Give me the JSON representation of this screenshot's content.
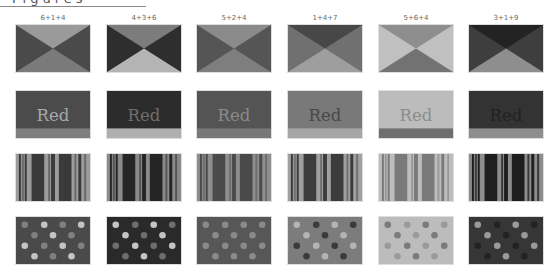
{
  "header": {
    "title": "Figures",
    "title_clipped": true
  },
  "columns": [
    {
      "label": "6+1+4"
    },
    {
      "label": "4+3+6"
    },
    {
      "label": "5+2+4"
    },
    {
      "label": "1+4+7"
    },
    {
      "label": "5+6+4"
    },
    {
      "label": "3+1+9"
    }
  ],
  "rows": {
    "hourglass": [
      {
        "top": "#9a9a9a",
        "sides": "#4a4a4a",
        "bottom": "#7a7a7a"
      },
      {
        "top": "#7c7c7c",
        "sides": "#2e2e2e",
        "bottom": "#b4b4b4"
      },
      {
        "top": "#8a8a8a",
        "sides": "#555555",
        "bottom": "#7e7e7e"
      },
      {
        "top": "#474747",
        "sides": "#707070",
        "bottom": "#9e9e9e"
      },
      {
        "top": "#8e8e8e",
        "sides": "#c0c0c0",
        "bottom": "#727272"
      },
      {
        "top": "#232323",
        "sides": "#3e3e3e",
        "bottom": "#8e8e8e"
      }
    ],
    "word_tiles": [
      {
        "word": "Red",
        "bg": "#4b4b4b",
        "text": "#a8a8a8",
        "band": "#7e7e7e"
      },
      {
        "word": "Red",
        "bg": "#2c2c2c",
        "text": "#6e6e6e",
        "band": "#b0b0b0"
      },
      {
        "word": "Red",
        "bg": "#545454",
        "text": "#8a8a8a",
        "band": "#787878"
      },
      {
        "word": "Red",
        "bg": "#797979",
        "text": "#484848",
        "band": "#a6a6a6"
      },
      {
        "word": "Red",
        "bg": "#bcbcbc",
        "text": "#8c8c8c",
        "band": "#6e6e6e"
      },
      {
        "word": "Red",
        "bg": "#333333",
        "text": "#222222",
        "band": "#8e8e8e"
      }
    ],
    "stripes": [
      {
        "a": "#9c9c9c",
        "b": "#3a3a3a",
        "c": "#6a6a6a"
      },
      {
        "a": "#8a8a8a",
        "b": "#252525",
        "c": "#555555"
      },
      {
        "a": "#8e8e8e",
        "b": "#4a4a4a",
        "c": "#6e6e6e"
      },
      {
        "a": "#a0a0a0",
        "b": "#3c3c3c",
        "c": "#707070"
      },
      {
        "a": "#bdbdbd",
        "b": "#7a7a7a",
        "c": "#9a9a9a"
      },
      {
        "a": "#8c8c8c",
        "b": "#1e1e1e",
        "c": "#3a3a3a"
      }
    ],
    "dots": [
      {
        "bg": "#4a4a4a",
        "d1": "#c4c4c4",
        "d2": "#808080"
      },
      {
        "bg": "#2a2a2a",
        "d1": "#c4c4c4",
        "d2": "#6e6e6e"
      },
      {
        "bg": "#575757",
        "d1": "#8a8a8a",
        "d2": "#8a8a8a"
      },
      {
        "bg": "#7c7c7c",
        "d1": "#b4b4b4",
        "d2": "#3a3a3a"
      },
      {
        "bg": "#bcbcbc",
        "d1": "#9a9a9a",
        "d2": "#7a7a7a"
      },
      {
        "bg": "#363636",
        "d1": "#9a9a9a",
        "d2": "#222222"
      }
    ]
  }
}
